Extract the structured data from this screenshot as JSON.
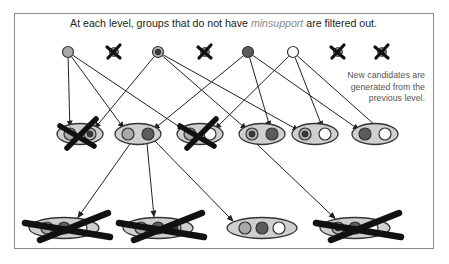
{
  "title": {
    "prefix": "At each level, groups that do not have ",
    "emphasis": "minsupport",
    "suffix": " are filtered out."
  },
  "note": {
    "lines": [
      "New candidates are",
      "generated from the",
      "previous level."
    ]
  },
  "colors": {
    "frame": "#8c8c8c",
    "stroke": "#333333",
    "emphasis": "#8a8a8a",
    "group_fill": "#cfcfcf",
    "item_a": "#a9a9a9",
    "item_b_outer": "#b3b3b3",
    "item_b_dot": "#3a3a3a",
    "item_c": "#5c5c5c",
    "item_d": "#ffffff",
    "filtered_blob": "#7d7d7d",
    "cross": "#111111"
  },
  "levels": [
    {
      "name": "level-1",
      "y": 52,
      "item_r": 5.5,
      "nodes": [
        {
          "id": "A",
          "x": 68,
          "items": [
            "a"
          ],
          "filtered": false
        },
        {
          "id": "X1",
          "x": 114,
          "items": [],
          "filtered": true
        },
        {
          "id": "B",
          "x": 158,
          "items": [
            "b"
          ],
          "filtered": false
        },
        {
          "id": "X2",
          "x": 205,
          "items": [],
          "filtered": true
        },
        {
          "id": "C",
          "x": 248,
          "items": [
            "c"
          ],
          "filtered": false
        },
        {
          "id": "D",
          "x": 293,
          "items": [
            "d"
          ],
          "filtered": false
        },
        {
          "id": "X3",
          "x": 338,
          "items": [],
          "filtered": true
        },
        {
          "id": "X4",
          "x": 382,
          "items": [],
          "filtered": true
        }
      ]
    },
    {
      "name": "level-2",
      "y": 134,
      "rx": 23,
      "ry": 10.5,
      "spacing": 20,
      "item_r": 6,
      "nodes": [
        {
          "id": "E1",
          "x": 80,
          "items": [
            "a",
            "b"
          ],
          "filtered": true
        },
        {
          "id": "E2",
          "x": 138,
          "items": [
            "a",
            "c"
          ],
          "filtered": false
        },
        {
          "id": "E3",
          "x": 200,
          "items": [
            "a",
            "d"
          ],
          "filtered": true
        },
        {
          "id": "E4",
          "x": 262,
          "items": [
            "b",
            "c"
          ],
          "filtered": false
        },
        {
          "id": "E5",
          "x": 315,
          "items": [
            "b",
            "d"
          ],
          "filtered": false
        },
        {
          "id": "E6",
          "x": 375,
          "items": [
            "c",
            "d"
          ],
          "filtered": false
        }
      ]
    },
    {
      "name": "level-3",
      "y": 228,
      "rx": 35,
      "ry": 10.5,
      "spacing": 17,
      "item_r": 6,
      "nodes": [
        {
          "id": "F1",
          "x": 64,
          "items": [
            "a",
            "c",
            "d"
          ],
          "filtered": true
        },
        {
          "id": "F2",
          "x": 158,
          "items": [
            "a",
            "c",
            "b"
          ],
          "filtered": true
        },
        {
          "id": "F3",
          "x": 262,
          "items": [
            "a",
            "c",
            "d"
          ],
          "filtered": false
        },
        {
          "id": "F4",
          "x": 355,
          "items": [
            "b",
            "c",
            "d"
          ],
          "filtered": true
        }
      ]
    }
  ],
  "edges": [
    {
      "from": "A",
      "to": "E1",
      "item": 0
    },
    {
      "from": "A",
      "to": "E2",
      "item": 0
    },
    {
      "from": "A",
      "to": "E3",
      "item": 0
    },
    {
      "from": "B",
      "to": "E1",
      "item": 1
    },
    {
      "from": "B",
      "to": "E4",
      "item": 0
    },
    {
      "from": "B",
      "to": "E5",
      "item": 0
    },
    {
      "from": "C",
      "to": "E2",
      "item": 1
    },
    {
      "from": "C",
      "to": "E4",
      "item": 1
    },
    {
      "from": "C",
      "to": "E6",
      "item": 0
    },
    {
      "from": "D",
      "to": "E3",
      "item": 1
    },
    {
      "from": "D",
      "to": "E5",
      "item": 1
    },
    {
      "from": "D",
      "to": "E6",
      "item": 1
    },
    {
      "from": "E2",
      "to": "F1",
      "sx": -8,
      "tx": 14
    },
    {
      "from": "E2",
      "to": "F2",
      "sx": 9,
      "tx": -4
    },
    {
      "from": "E2",
      "to": "F3",
      "sx": 17,
      "tx": -29
    },
    {
      "from": "E4",
      "to": "F4",
      "sx": -5,
      "tx": -20
    }
  ]
}
